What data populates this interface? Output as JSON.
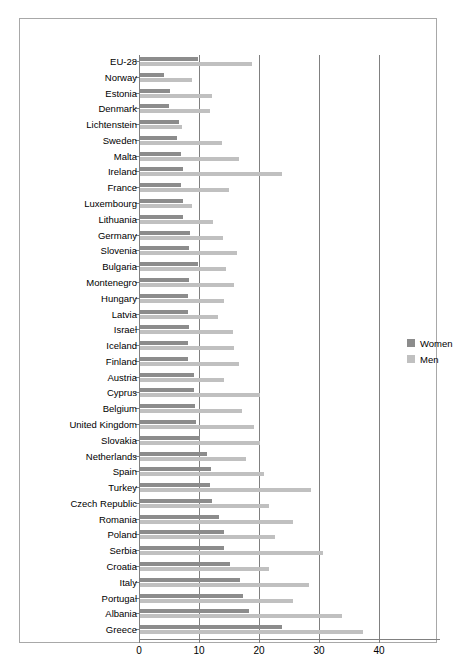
{
  "chart_data": {
    "type": "bar",
    "orientation": "horizontal",
    "title": "",
    "subtitle": "",
    "xlabel": "",
    "ylabel": "",
    "xlim": [
      0,
      50
    ],
    "xticks": [
      0,
      10,
      20,
      30,
      40
    ],
    "xtick_labels": [
      "0",
      "10",
      "20",
      "30",
      "40"
    ],
    "gridlines": {
      "vertical": [
        10,
        20,
        30,
        40
      ],
      "horizontal": false
    },
    "legend": {
      "position": "right",
      "entries": [
        {
          "name": "Women",
          "color": "#8c8c8c"
        },
        {
          "name": "Men",
          "color": "#c0c0c0"
        }
      ]
    },
    "categories": [
      "EU-28",
      "Norway",
      "Estonia",
      "Denmark",
      "Lichtenstein",
      "Sweden",
      "Malta",
      "Ireland",
      "France",
      "Luxembourg",
      "Lithuania",
      "Germany",
      "Slovenia",
      "Bulgaria",
      "Montenegro",
      "Hungary",
      "Latvia",
      "Israel",
      "Iceland",
      "Finland",
      "Austria",
      "Cyprus",
      "Belgium",
      "United Kingdom",
      "Slovakia",
      "Netherlands",
      "Spain",
      "Turkey",
      "Czech Republic",
      "Romania",
      "Poland",
      "Serbia",
      "Croatia",
      "Italy",
      "Portugal",
      "Albania",
      "Greece"
    ],
    "series": [
      {
        "name": "Women",
        "color": "#8c8c8c",
        "values": [
          9.8,
          4.1,
          5.2,
          5.0,
          6.6,
          6.3,
          7.0,
          7.3,
          7.0,
          7.3,
          7.3,
          8.5,
          8.4,
          9.8,
          8.4,
          8.2,
          8.1,
          8.4,
          8.1,
          8.1,
          9.1,
          9.1,
          9.4,
          9.5,
          10.2,
          11.3,
          12.0,
          11.8,
          12.2,
          13.4,
          14.2,
          14.1,
          15.2,
          16.9,
          17.3,
          18.3,
          23.8
        ]
      },
      {
        "name": "Men",
        "color": "#c0c0c0",
        "values": [
          18.8,
          8.9,
          12.2,
          11.8,
          7.2,
          13.8,
          16.7,
          23.8,
          15.0,
          8.9,
          12.4,
          14.0,
          16.3,
          14.5,
          15.9,
          14.2,
          13.1,
          15.7,
          15.9,
          16.7,
          14.1,
          20.1,
          17.2,
          19.1,
          20.2,
          17.9,
          20.9,
          28.7,
          21.7,
          25.7,
          22.7,
          30.7,
          21.6,
          28.4,
          25.6,
          33.9,
          37.3
        ]
      }
    ]
  }
}
